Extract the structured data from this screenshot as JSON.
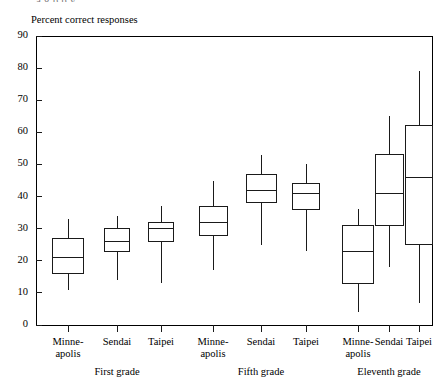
{
  "figure": {
    "cut_off_header": "a g  p     p        y",
    "axis_title": "Percent correct responses"
  },
  "chart_data": {
    "type": "box",
    "title": "",
    "xlabel": "",
    "ylabel": "Percent correct responses",
    "ylim": [
      0,
      90
    ],
    "yticks": [
      0,
      10,
      20,
      30,
      40,
      50,
      60,
      70,
      80,
      90
    ],
    "ytick_labels": [
      "0",
      "10",
      "20",
      "30",
      "40",
      "50",
      "60",
      "70",
      "80",
      "90"
    ],
    "grid": false,
    "legend": "none",
    "groups": [
      {
        "name": "First grade",
        "categories": [
          "Minne-\napolis",
          "Sendai",
          "Taipei"
        ]
      },
      {
        "name": "Fifth grade",
        "categories": [
          "Minne-\napolis",
          "Sendai",
          "Taipei"
        ]
      },
      {
        "name": "Eleventh grade",
        "categories": [
          "Minne-\napolis",
          "Sendai",
          "Taipei"
        ]
      }
    ],
    "boxes": [
      {
        "group": "First grade",
        "category": "Minneapolis",
        "whisker_low": 11,
        "q1": 16,
        "median": 21,
        "q3": 27,
        "whisker_high": 33
      },
      {
        "group": "First grade",
        "category": "Sendai",
        "whisker_low": 14,
        "q1": 23,
        "median": 26,
        "q3": 30,
        "whisker_high": 34
      },
      {
        "group": "First grade",
        "category": "Taipei",
        "whisker_low": 13,
        "q1": 26,
        "median": 30,
        "q3": 32,
        "whisker_high": 37
      },
      {
        "group": "Fifth grade",
        "category": "Minneapolis",
        "whisker_low": 17,
        "q1": 28,
        "median": 32,
        "q3": 37,
        "whisker_high": 45
      },
      {
        "group": "Fifth grade",
        "category": "Sendai",
        "whisker_low": 25,
        "q1": 38,
        "median": 42,
        "q3": 47,
        "whisker_high": 53
      },
      {
        "group": "Fifth grade",
        "category": "Taipei",
        "whisker_low": 23,
        "q1": 36,
        "median": 41,
        "q3": 44,
        "whisker_high": 50
      },
      {
        "group": "Eleventh grade",
        "category": "Minneapolis",
        "whisker_low": 4,
        "q1": 13,
        "median": 23,
        "q3": 31,
        "whisker_high": 36
      },
      {
        "group": "Eleventh grade",
        "category": "Sendai",
        "whisker_low": 18,
        "q1": 31,
        "median": 41,
        "q3": 53,
        "whisker_high": 65
      },
      {
        "group": "Eleventh grade",
        "category": "Taipei",
        "whisker_low": 7,
        "q1": 25,
        "median": 46,
        "q3": 62,
        "whisker_high": 79
      }
    ],
    "style": {
      "line_color": "#1a1a1a",
      "box_fill": "#ffffff",
      "frame_color": "#000000"
    }
  }
}
